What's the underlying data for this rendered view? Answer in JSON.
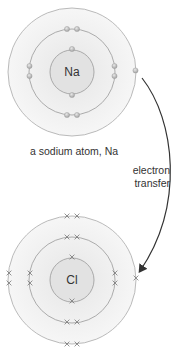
{
  "diagram": {
    "type": "electron-transfer",
    "atoms": [
      {
        "symbol": "Na",
        "caption": "a sodium atom, Na",
        "electron_marker": "dot",
        "shells": [
          2,
          8,
          1
        ]
      },
      {
        "symbol": "Cl",
        "caption": "",
        "electron_marker": "cross",
        "shells": [
          2,
          8,
          7
        ]
      }
    ],
    "arrow_label_line1": "electron",
    "arrow_label_line2": "transfer",
    "colors": {
      "shell_line": "#a8a8a8",
      "shell_fill": "#ececec",
      "electron_dot": "#b8b8b8",
      "cross": "#888888",
      "arrow": "#333333",
      "text": "#333333"
    }
  }
}
